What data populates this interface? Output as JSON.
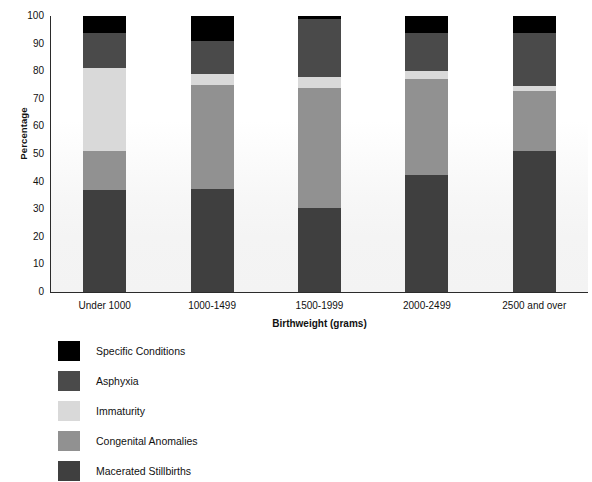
{
  "chart_data": {
    "type": "bar",
    "subtype": "stacked-bar-100-percent",
    "title": "",
    "xlabel": "Birthweight (grams)",
    "ylabel": "Percentage",
    "ylim": [
      0,
      100
    ],
    "yticks": [
      0,
      10,
      20,
      30,
      40,
      50,
      60,
      70,
      80,
      90,
      100
    ],
    "ytick_labels": [
      "0",
      "10",
      "20",
      "30",
      "40",
      "50",
      "60",
      "70",
      "80",
      "90",
      "100"
    ],
    "grid": false,
    "legend_position": "below-plot-left",
    "categories": [
      "Under 1000",
      "1000-1499",
      "1500-1999",
      "2000-2499",
      "2500 and over"
    ],
    "series": [
      {
        "name": "Macerated Stillbirths",
        "color": "#3f3f3f",
        "values": [
          37,
          37.5,
          30.5,
          42.5,
          51
        ]
      },
      {
        "name": "Congenital Anomalies",
        "color": "#919191",
        "values": [
          14,
          37.5,
          43.5,
          34.5,
          22
        ]
      },
      {
        "name": "Immaturity",
        "color": "#d9d9d9",
        "values": [
          30,
          4,
          4,
          3,
          1.5
        ]
      },
      {
        "name": "Asphyxia",
        "color": "#4a4a4a",
        "values": [
          13,
          12,
          21,
          14,
          19.5
        ]
      },
      {
        "name": "Specific Conditions",
        "color": "#000000",
        "values": [
          6,
          9,
          1,
          6,
          6
        ]
      }
    ],
    "legend_entries": [
      {
        "label": "Specific Conditions",
        "color": "#000000"
      },
      {
        "label": "Asphyxia",
        "color": "#4a4a4a"
      },
      {
        "label": "Immaturity",
        "color": "#d9d9d9"
      },
      {
        "label": "Congenital Anomalies",
        "color": "#919191"
      },
      {
        "label": "Macerated Stillbirths",
        "color": "#3f3f3f"
      }
    ]
  }
}
